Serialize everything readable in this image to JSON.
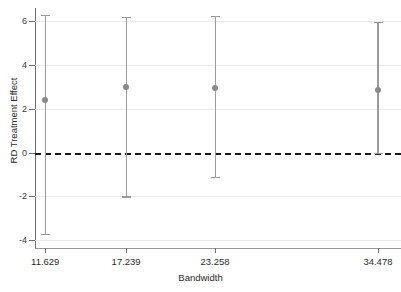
{
  "chart_data": {
    "type": "scatter",
    "title": "",
    "xlabel": "Bandwidth",
    "ylabel": "RD Treatment Effect",
    "grid": true,
    "legend": null,
    "ylim": [
      -4.4,
      6.6
    ],
    "yticks": [
      6,
      4,
      2,
      0,
      -2,
      -4
    ],
    "ytick_labels": [
      "6",
      "4",
      "2",
      "0",
      "-2",
      "-4"
    ],
    "xtick_labels": [
      "11.629",
      "17.239",
      "23.258",
      "34.478"
    ],
    "categories": [
      "11.629",
      "17.239",
      "23.258",
      "34.478"
    ],
    "x": [
      11.629,
      17.239,
      23.258,
      34.478
    ],
    "values": [
      2.4,
      3.0,
      2.97,
      2.85
    ],
    "ci_lower": [
      -3.7,
      -2.0,
      -1.1,
      0.0
    ],
    "ci_upper": [
      6.3,
      6.2,
      6.25,
      5.95
    ],
    "reference_line": {
      "y": 0,
      "style": "dashed",
      "color": "#1a1a1a"
    },
    "marker_color": "#8a8a8a",
    "errorbar_color": "#9b9b9b",
    "gridline_color": "#e9e9e9",
    "annotations": []
  }
}
